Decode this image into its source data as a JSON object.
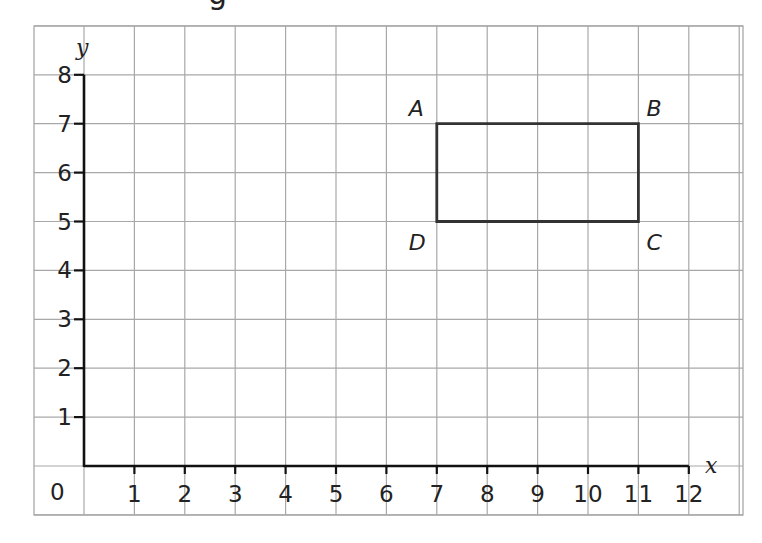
{
  "header": {
    "cropped_title_fragment": "g"
  },
  "grid": {
    "color": "#a8a8a8",
    "axis_color": "#111111",
    "shape_color": "#333333"
  },
  "axes": {
    "x_label": "x",
    "y_label": "y",
    "origin_label": "0",
    "x_ticks": [
      "1",
      "2",
      "3",
      "4",
      "5",
      "6",
      "7",
      "8",
      "9",
      "10",
      "11",
      "12"
    ],
    "y_ticks": [
      "1",
      "2",
      "3",
      "4",
      "5",
      "6",
      "7",
      "8"
    ]
  },
  "shape": {
    "type": "rectangle",
    "vertices": [
      {
        "label": "A",
        "x": 7,
        "y": 7
      },
      {
        "label": "B",
        "x": 11,
        "y": 7
      },
      {
        "label": "C",
        "x": 11,
        "y": 5
      },
      {
        "label": "D",
        "x": 7,
        "y": 5
      }
    ]
  },
  "chart_data": {
    "type": "scatter",
    "title": "",
    "xlabel": "x",
    "ylabel": "y",
    "xlim": [
      0,
      12
    ],
    "ylim": [
      0,
      8
    ],
    "grid": true,
    "x_tick_labels": [
      "0",
      "1",
      "2",
      "3",
      "4",
      "5",
      "6",
      "7",
      "8",
      "9",
      "10",
      "11",
      "12"
    ],
    "y_tick_labels": [
      "1",
      "2",
      "3",
      "4",
      "5",
      "6",
      "7",
      "8"
    ],
    "series": [
      {
        "name": "Rectangle ABCD",
        "points": [
          {
            "label": "A",
            "x": 7,
            "y": 7
          },
          {
            "label": "B",
            "x": 11,
            "y": 7
          },
          {
            "label": "C",
            "x": 11,
            "y": 5
          },
          {
            "label": "D",
            "x": 7,
            "y": 5
          }
        ],
        "closed": true
      }
    ]
  }
}
